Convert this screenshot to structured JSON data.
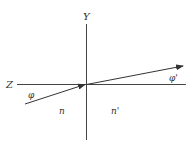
{
  "diagram": {
    "type": "refraction-geometry",
    "axes": {
      "vertical_label": "Y",
      "horizontal_label": "Z"
    },
    "rays": {
      "incident_angle_label": "φ",
      "refracted_angle_label": "φ'"
    },
    "media": {
      "left_index": "n",
      "right_index": "n'"
    },
    "colors": {
      "line": "#444444",
      "text": "#333333",
      "background": "#ffffff"
    }
  }
}
